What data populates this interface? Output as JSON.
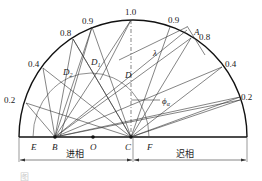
{
  "diagram": {
    "type": "power-factor-semicircle",
    "scale_labels_left": [
      "0.2",
      "0.4",
      "0.8",
      "0.9"
    ],
    "scale_label_top": "1.0",
    "scale_labels_right": [
      "0.9",
      "0.8",
      "0.4",
      "0.2"
    ],
    "point_labels": {
      "A": "A",
      "B": "B",
      "C": "C",
      "D": "D",
      "D1": "D",
      "D1_sub": "1",
      "D2": "D",
      "D2_sub": "2",
      "E": "E",
      "F": "F",
      "O": "O"
    },
    "angle_label": "ϕ",
    "angle_sub": "α",
    "lambda_label": "λ",
    "region_left": "进相",
    "region_right": "迟相",
    "caption": "图"
  }
}
